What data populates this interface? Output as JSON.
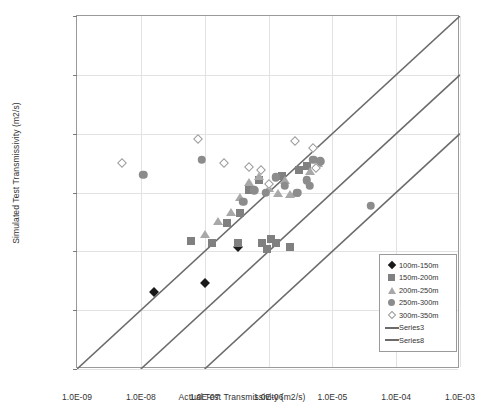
{
  "chart_data": {
    "type": "scatter",
    "title": "",
    "xlabel": "Actual Test Transmissivity (m2/s)",
    "ylabel": "Simulated Test Transmissivity (m2/s)",
    "xscale": "log",
    "yscale": "log",
    "xlim": [
      1e-09,
      0.001
    ],
    "ylim": [
      1e-09,
      0.001
    ],
    "grid": true,
    "legend_position": "bottom-right",
    "xticks": [
      "1.0E-09",
      "1.0E-08",
      "1.0E-07",
      "1.0E-06",
      "1.0E-05",
      "1.0E-04",
      "1.0E-03"
    ],
    "yticks": [
      "1.0E-09",
      "1.0E-08",
      "1.0E-07",
      "1.0E-06",
      "1.0E-05",
      "1.0E-04",
      "1.0E-03"
    ],
    "xtick_values": [
      1e-09,
      1e-08,
      1e-07,
      1e-06,
      1e-05,
      0.0001,
      0.001
    ],
    "ytick_values": [
      1e-09,
      1e-08,
      1e-07,
      1e-06,
      1e-05,
      0.0001,
      0.001
    ],
    "series": [
      {
        "name": "100m-150m",
        "marker": "diamond",
        "color": "#1a1a1a",
        "points": [
          [
            1.6e-08,
            2e-08
          ],
          [
            1e-07,
            2.9e-08
          ],
          [
            3.3e-07,
            1.2e-07
          ]
        ]
      },
      {
        "name": "150m-200m",
        "marker": "square",
        "color": "#808080",
        "points": [
          [
            6e-08,
            1.5e-07
          ],
          [
            1.3e-07,
            1.4e-07
          ],
          [
            2.2e-07,
            3e-07
          ],
          [
            3.3e-07,
            1.4e-07
          ],
          [
            3.6e-07,
            4.4e-07
          ],
          [
            5e-07,
            1.1e-06
          ],
          [
            7e-07,
            1.6e-06
          ],
          [
            8e-07,
            1.4e-07
          ],
          [
            9.5e-07,
            1.1e-07
          ],
          [
            1.1e-06,
            1.6e-07
          ],
          [
            1.3e-06,
            1.4e-07
          ],
          [
            1.6e-06,
            1.9e-06
          ],
          [
            2.2e-06,
            1.2e-07
          ],
          [
            3e-06,
            2.4e-06
          ],
          [
            4e-06,
            2.8e-06
          ]
        ]
      },
      {
        "name": "200m-250m",
        "marker": "triangle",
        "color": "#a8a8a8",
        "points": [
          [
            1e-07,
            2e-07
          ],
          [
            1.6e-07,
            3.3e-07
          ],
          [
            2.6e-07,
            4.6e-07
          ],
          [
            3.6e-07,
            8.4e-07
          ],
          [
            5e-07,
            1.5e-06
          ],
          [
            7e-07,
            1.9e-06
          ],
          [
            1e-06,
            1.2e-06
          ],
          [
            1.4e-06,
            1e-06
          ],
          [
            1.8e-06,
            1.6e-06
          ],
          [
            2.2e-06,
            9.5e-07
          ],
          [
            2.6e-06,
            1e-06
          ],
          [
            4.5e-06,
            2.3e-06
          ],
          [
            6e-06,
            3.2e-06
          ]
        ]
      },
      {
        "name": "250m-300m",
        "marker": "circle",
        "color": "#8c8c8c",
        "points": [
          [
            1.1e-08,
            2e-06
          ],
          [
            9e-08,
            3.6e-06
          ],
          [
            4e-07,
            7e-07
          ],
          [
            6e-07,
            1.1e-06
          ],
          [
            9e-07,
            1e-06
          ],
          [
            1.3e-06,
            1.8e-06
          ],
          [
            1.8e-06,
            1.3e-06
          ],
          [
            2.8e-06,
            1e-06
          ],
          [
            4e-06,
            1.6e-06
          ],
          [
            4.4e-06,
            1.3e-06
          ],
          [
            5e-06,
            3.6e-06
          ],
          [
            6.5e-06,
            3.4e-06
          ],
          [
            4e-05,
            6e-07
          ]
        ]
      },
      {
        "name": "300m-350m",
        "marker": "open-diamond",
        "color": "#9b9b9b",
        "points": [
          [
            5e-09,
            3.2e-06
          ],
          [
            8e-08,
            8.2e-06
          ],
          [
            2e-07,
            3.2e-06
          ],
          [
            5e-07,
            2.7e-06
          ],
          [
            7.5e-07,
            2.4e-06
          ],
          [
            1e-06,
            1.4e-06
          ],
          [
            2.6e-06,
            7.6e-06
          ],
          [
            5e-06,
            5.6e-06
          ],
          [
            5.5e-06,
            2.6e-06
          ]
        ]
      }
    ],
    "reference_lines": [
      {
        "name": "Series3",
        "color": "#6b6b6b",
        "from": [
          1e-09,
          1e-09
        ],
        "to": [
          0.001,
          0.001
        ],
        "note": "1:1 shifted, y = 100x"
      },
      {
        "name": "Series8",
        "color": "#6b6b6b",
        "from": [
          1e-08,
          1e-09
        ],
        "to": [
          0.001,
          0.0001
        ],
        "note": "y = x"
      },
      {
        "name": "Series-lower",
        "color": "#6b6b6b",
        "from": [
          1e-07,
          1e-09
        ],
        "to": [
          0.001,
          1e-05
        ],
        "note": "y = x/100"
      }
    ]
  },
  "legend": {
    "items": [
      {
        "label": "100m-150m",
        "symbol": "diamond"
      },
      {
        "label": "150m-200m",
        "symbol": "square"
      },
      {
        "label": "200m-250m",
        "symbol": "triangle"
      },
      {
        "label": "250m-300m",
        "symbol": "circle"
      },
      {
        "label": "300m-350m",
        "symbol": "open-diamond"
      },
      {
        "label": "Series3",
        "symbol": "line"
      },
      {
        "label": "Series8",
        "symbol": "line"
      }
    ]
  }
}
